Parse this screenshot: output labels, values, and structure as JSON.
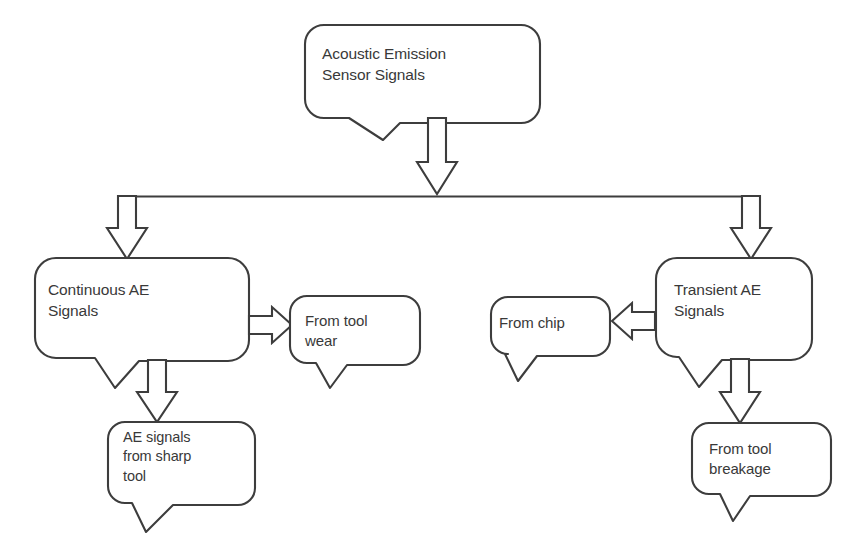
{
  "diagram": {
    "type": "flowchart",
    "stroke_color": "#3d3d3d",
    "text_color": "#393939",
    "background_color": "#ffffff",
    "nodes": [
      {
        "id": "root",
        "label": "Acoustic Emission\nSensor Signals",
        "shape": "rounded-callout",
        "level": 0
      },
      {
        "id": "continuous",
        "label": "Continuous AE\nSignals",
        "shape": "rounded-callout",
        "level": 1
      },
      {
        "id": "transient",
        "label": "Transient AE\nSignals",
        "shape": "rounded-callout",
        "level": 1
      },
      {
        "id": "tool-wear",
        "label": "From tool\nwear",
        "shape": "rounded-callout",
        "level": 2
      },
      {
        "id": "chip",
        "label": "From chip",
        "shape": "rounded-callout",
        "level": 2
      },
      {
        "id": "sharp-tool",
        "label": "AE signals\nfrom sharp\ntool",
        "shape": "rounded-callout",
        "level": 2
      },
      {
        "id": "tool-breakage",
        "label": "From tool\nbreakage",
        "shape": "rounded-callout",
        "level": 2
      }
    ],
    "edges": [
      {
        "from": "root",
        "to": "branch-bus",
        "direction": "down",
        "style": "hollow-block-arrow"
      },
      {
        "from": "branch-bus",
        "to": "continuous",
        "direction": "down",
        "style": "hollow-block-arrow"
      },
      {
        "from": "branch-bus",
        "to": "transient",
        "direction": "down",
        "style": "hollow-block-arrow"
      },
      {
        "from": "continuous",
        "to": "tool-wear",
        "direction": "right",
        "style": "hollow-block-arrow"
      },
      {
        "from": "continuous",
        "to": "sharp-tool",
        "direction": "down",
        "style": "hollow-block-arrow"
      },
      {
        "from": "transient",
        "to": "chip",
        "direction": "left",
        "style": "hollow-block-arrow"
      },
      {
        "from": "transient",
        "to": "tool-breakage",
        "direction": "down",
        "style": "hollow-block-arrow"
      }
    ]
  }
}
